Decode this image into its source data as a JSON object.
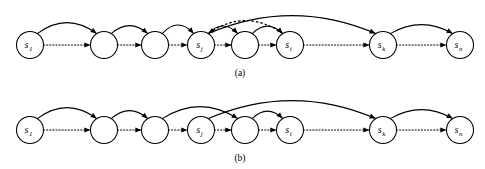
{
  "figure": {
    "width": 485,
    "height": 169,
    "background_color": "#ffffff",
    "stroke_color": "#000000"
  },
  "panels": [
    {
      "id": "panel-a",
      "caption": "(a)",
      "caption_x": 240,
      "caption_y": 76,
      "baseline_y": 45,
      "node_radius": 13.5,
      "nodes": [
        {
          "id": "a-n1",
          "label": "s",
          "sub": "1",
          "cx": 30,
          "cy": 45
        },
        {
          "id": "a-n2",
          "label": "",
          "sub": "",
          "cx": 104,
          "cy": 45
        },
        {
          "id": "a-n3",
          "label": "",
          "sub": "",
          "cx": 155,
          "cy": 45
        },
        {
          "id": "a-n4",
          "label": "s",
          "sub": "j",
          "cx": 201,
          "cy": 45
        },
        {
          "id": "a-n5",
          "label": "",
          "sub": "",
          "cx": 245,
          "cy": 45
        },
        {
          "id": "a-n6",
          "label": "s",
          "sub": "i",
          "cx": 290,
          "cy": 45
        },
        {
          "id": "a-n7",
          "label": "s",
          "sub": "k",
          "cx": 383,
          "cy": 45
        },
        {
          "id": "a-n8",
          "label": "s",
          "sub": "n",
          "cx": 460,
          "cy": 45
        }
      ],
      "chain_links": [
        {
          "from": "a-n1",
          "to": "a-n2"
        },
        {
          "from": "a-n2",
          "to": "a-n3"
        },
        {
          "from": "a-n3",
          "to": "a-n4"
        },
        {
          "from": "a-n4",
          "to": "a-n5"
        },
        {
          "from": "a-n5",
          "to": "a-n6"
        },
        {
          "from": "a-n6",
          "to": "a-n7"
        },
        {
          "from": "a-n7",
          "to": "a-n8"
        }
      ],
      "arcs": [
        {
          "id": "a-arc-1",
          "from": "a-n1",
          "to": "a-n2",
          "style": "solid",
          "height": 22
        },
        {
          "id": "a-arc-2",
          "from": "a-n2",
          "to": "a-n3",
          "style": "solid",
          "height": 16
        },
        {
          "id": "a-arc-3",
          "from": "a-n3",
          "to": "a-n4",
          "style": "solid",
          "height": 17
        },
        {
          "id": "a-arc-4",
          "from": "a-n4",
          "to": "a-n5",
          "style": "solid",
          "height": 15
        },
        {
          "id": "a-arc-5",
          "from": "a-n5",
          "to": "a-n6",
          "style": "solid",
          "height": 15
        },
        {
          "id": "a-arc-6",
          "from": "a-n4",
          "to": "a-n7",
          "style": "solid",
          "height": 36
        },
        {
          "id": "a-arc-7",
          "from": "a-n7",
          "to": "a-n8",
          "style": "solid",
          "height": 18
        },
        {
          "id": "a-arc-dashed",
          "from": "a-n6",
          "to": "a-n4",
          "style": "dashed",
          "height": 26
        }
      ]
    },
    {
      "id": "panel-b",
      "caption": "(b)",
      "caption_x": 240,
      "caption_y": 161,
      "baseline_y": 130,
      "node_radius": 13.5,
      "nodes": [
        {
          "id": "b-n1",
          "label": "s",
          "sub": "1",
          "cx": 30,
          "cy": 130
        },
        {
          "id": "b-n2",
          "label": "",
          "sub": "",
          "cx": 104,
          "cy": 130
        },
        {
          "id": "b-n3",
          "label": "",
          "sub": "",
          "cx": 155,
          "cy": 130
        },
        {
          "id": "b-n4",
          "label": "s",
          "sub": "j",
          "cx": 201,
          "cy": 130
        },
        {
          "id": "b-n5",
          "label": "",
          "sub": "",
          "cx": 245,
          "cy": 130
        },
        {
          "id": "b-n6",
          "label": "s",
          "sub": "i",
          "cx": 290,
          "cy": 130
        },
        {
          "id": "b-n7",
          "label": "s",
          "sub": "k",
          "cx": 383,
          "cy": 130
        },
        {
          "id": "b-n8",
          "label": "s",
          "sub": "n",
          "cx": 460,
          "cy": 130
        }
      ],
      "chain_links": [
        {
          "from": "b-n1",
          "to": "b-n2"
        },
        {
          "from": "b-n2",
          "to": "b-n3"
        },
        {
          "from": "b-n3",
          "to": "b-n4"
        },
        {
          "from": "b-n4",
          "to": "b-n5"
        },
        {
          "from": "b-n5",
          "to": "b-n6"
        },
        {
          "from": "b-n6",
          "to": "b-n7"
        },
        {
          "from": "b-n7",
          "to": "b-n8"
        }
      ],
      "arcs": [
        {
          "id": "b-arc-1",
          "from": "b-n1",
          "to": "b-n2",
          "style": "solid",
          "height": 22
        },
        {
          "id": "b-arc-2",
          "from": "b-n2",
          "to": "b-n3",
          "style": "solid",
          "height": 16
        },
        {
          "id": "b-arc-3",
          "from": "b-n3",
          "to": "b-n5",
          "style": "solid",
          "height": 24
        },
        {
          "id": "b-arc-4",
          "from": "b-n5",
          "to": "b-n6",
          "style": "solid",
          "height": 15
        },
        {
          "id": "b-arc-5",
          "from": "b-n4",
          "to": "b-n7",
          "style": "solid",
          "height": 36
        },
        {
          "id": "b-arc-6",
          "from": "b-n7",
          "to": "b-n8",
          "style": "solid",
          "height": 18
        }
      ]
    }
  ]
}
